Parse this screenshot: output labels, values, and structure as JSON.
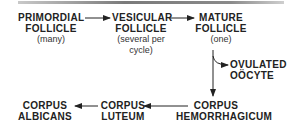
{
  "diagram": {
    "type": "flowchart",
    "title": "",
    "nodes": [
      {
        "id": "primordial",
        "lines": [
          "PRIMORDIAL",
          "FOLLICLE"
        ],
        "note": "(many)"
      },
      {
        "id": "vesicular",
        "lines": [
          "VESICULAR",
          "FOLLICLE"
        ],
        "note": [
          "(several per",
          "cycle)"
        ]
      },
      {
        "id": "mature",
        "lines": [
          "MATURE",
          "FOLLICLE"
        ],
        "note": "(one)"
      },
      {
        "id": "ovulated",
        "lines": [
          "OVULATED",
          "OÖCYTE"
        ]
      },
      {
        "id": "hemorrhagicum",
        "lines": [
          "CORPUS",
          "HEMORRHAGICUM"
        ]
      },
      {
        "id": "luteum",
        "lines": [
          "CORPUS",
          "LUTEUM"
        ]
      },
      {
        "id": "albicans",
        "lines": [
          "CORPUS",
          "ALBICANS"
        ]
      }
    ],
    "edges": [
      {
        "from": "primordial",
        "to": "vesicular"
      },
      {
        "from": "vesicular",
        "to": "mature"
      },
      {
        "from": "mature",
        "to": "ovulated"
      },
      {
        "from": "mature",
        "to": "hemorrhagicum"
      },
      {
        "from": "hemorrhagicum",
        "to": "luteum"
      },
      {
        "from": "luteum",
        "to": "albicans"
      }
    ],
    "colors": {
      "text": "#222222",
      "line": "#222222",
      "rule": "#8a8a8a"
    }
  }
}
